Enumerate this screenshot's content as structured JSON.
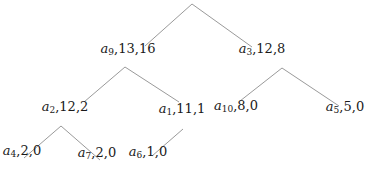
{
  "diagram": {
    "type": "tree",
    "edge_color": "#9a9a9a",
    "text_color": "#1a1a1a",
    "root": {
      "label": "",
      "x": 192,
      "y": 4
    },
    "nodes": [
      {
        "id": "n9",
        "var": "a",
        "sub": "9",
        "values": ",13,16",
        "x": 128,
        "y": 52
      },
      {
        "id": "n3",
        "var": "a",
        "sub": "3",
        "values": ",12,8",
        "x": 262,
        "y": 52
      },
      {
        "id": "n2",
        "var": "a",
        "sub": "2",
        "values": ",12,2",
        "x": 65,
        "y": 110
      },
      {
        "id": "n1",
        "var": "a",
        "sub": "1",
        "values": ",11,1",
        "x": 182,
        "y": 112
      },
      {
        "id": "n10",
        "var": "a",
        "sub": "10",
        "values": ",8,0",
        "x": 236,
        "y": 109
      },
      {
        "id": "n5",
        "var": "a",
        "sub": "5",
        "values": ",5,0",
        "x": 345,
        "y": 110
      },
      {
        "id": "n4",
        "var": "a",
        "sub": "4",
        "values": ",2,0",
        "x": 22,
        "y": 154
      },
      {
        "id": "n7",
        "var": "a",
        "sub": "7",
        "values": ",2,0",
        "x": 97,
        "y": 156
      },
      {
        "id": "n6",
        "var": "a",
        "sub": "6",
        "values": ",1,0",
        "x": 148,
        "y": 155
      }
    ],
    "edges": [
      {
        "from": "root",
        "to": "n9",
        "x1": 192,
        "y1": 4,
        "x2": 145,
        "y2": 46
      },
      {
        "from": "root",
        "to": "n3",
        "x1": 192,
        "y1": 4,
        "x2": 252,
        "y2": 47
      },
      {
        "from": "n9",
        "to": "n2",
        "x1": 125,
        "y1": 67,
        "x2": 84,
        "y2": 102
      },
      {
        "from": "n9",
        "to": "n1",
        "x1": 125,
        "y1": 67,
        "x2": 179,
        "y2": 102
      },
      {
        "from": "n3",
        "to": "n10",
        "x1": 282,
        "y1": 68,
        "x2": 240,
        "y2": 101
      },
      {
        "from": "n3",
        "to": "n5",
        "x1": 282,
        "y1": 68,
        "x2": 339,
        "y2": 106
      },
      {
        "from": "n2",
        "to": "n4",
        "x1": 61,
        "y1": 126,
        "x2": 24,
        "y2": 158
      },
      {
        "from": "n2",
        "to": "n7",
        "x1": 61,
        "y1": 126,
        "x2": 100,
        "y2": 160
      },
      {
        "from": "n1",
        "to": "n6",
        "x1": 183,
        "y1": 129,
        "x2": 152,
        "y2": 156
      }
    ]
  }
}
